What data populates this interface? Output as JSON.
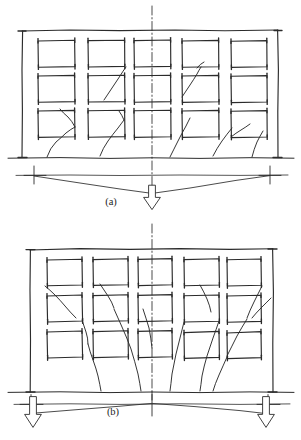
{
  "figure": {
    "background_color": "#ffffff",
    "ink_color": "#2b2b2b",
    "width_px": 301,
    "height_px": 440,
    "style": "hand-drawn line sketch"
  },
  "panels": [
    {
      "id": "a",
      "label": "(a)",
      "label_x": 111,
      "label_y": 205,
      "settlement_mode": "sagging",
      "description": "Wall sags at mid-span; diagonal cracks fan upward and inward toward the centre from the base",
      "frame": {
        "x": 22,
        "y": 30,
        "width": 256,
        "height": 128
      },
      "ground_line": {
        "x1": 8,
        "y1": 158,
        "x2": 294,
        "y2": 158
      },
      "centerline": {
        "x": 152,
        "y1": 6,
        "y2": 196
      },
      "openings": {
        "columns": 5,
        "rows": 3,
        "cell_width": 37,
        "cell_height": 27,
        "col_x": [
          38,
          88,
          134,
          182,
          231
        ],
        "row_y": [
          40,
          75,
          110
        ]
      },
      "deflection": {
        "shape": "v-sag",
        "reference_line": {
          "x1": 16,
          "y": 175,
          "x2": 288
        },
        "vertex_x": 152,
        "vertex_y": 193,
        "left_support_x": 34,
        "right_support_x": 270,
        "support_y": 175
      },
      "arrows": [
        {
          "name": "centre-settlement-arrow",
          "x": 152,
          "y_top": 184,
          "direction": "down"
        }
      ]
    },
    {
      "id": "b",
      "label": "(b)",
      "label_x": 113,
      "label_y": 415,
      "settlement_mode": "hogging",
      "description": "Wall hogs over mid-span; diagonal cracks fan downward and outward toward both ends",
      "frame": {
        "x": 30,
        "y": 248,
        "width": 243,
        "height": 144
      },
      "ground_line": {
        "x1": 8,
        "y1": 392,
        "x2": 294,
        "y2": 392
      },
      "centerline": {
        "x": 152,
        "y1": 224,
        "y2": 400
      },
      "openings": {
        "columns": 5,
        "rows": 3,
        "cell_width": 35,
        "cell_height": 26,
        "col_x": [
          47,
          93,
          138,
          184,
          227
        ],
        "row_y": [
          262,
          298,
          333
        ]
      },
      "deflection": {
        "shape": "inverted-v-hog",
        "reference_line": {
          "x1": 14,
          "y": 404,
          "x2": 290
        },
        "vertex_x": 152,
        "vertex_y": 403,
        "left_support_x": 31,
        "right_support_x": 268,
        "left_end_y": 413,
        "right_end_y": 414
      },
      "arrows": [
        {
          "name": "left-settlement-arrow",
          "x": 33,
          "y_top": 412,
          "direction": "down"
        },
        {
          "name": "right-settlement-arrow",
          "x": 266,
          "y_top": 412,
          "direction": "down"
        }
      ]
    }
  ]
}
